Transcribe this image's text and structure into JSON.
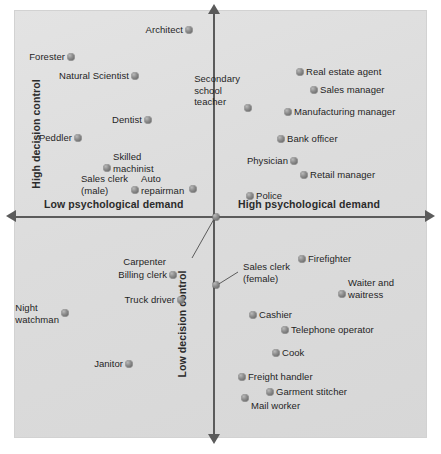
{
  "chart_data": {
    "type": "scatter",
    "title": "",
    "subtitle": "",
    "xlabel": "Psychological demand",
    "ylabel": "Decision control",
    "xlim": [
      0,
      100
    ],
    "ylim": [
      0,
      100
    ],
    "grid": false,
    "legend": null,
    "quadrant_axes": {
      "x_low_label": "Low psychological demand",
      "x_high_label": "High psychological demand",
      "y_high_label": "High decision control",
      "y_low_label": "Low decision control"
    },
    "marker_color": "#7d7d7d",
    "panel_color": "#dedede",
    "axis_color": "#5b5b5b",
    "points": [
      {
        "label": "Architect",
        "x": 42.3,
        "y": 95.3,
        "label_pos": "left",
        "quadrant": "high-control-low-demand"
      },
      {
        "label": "Forester",
        "x": 13.8,
        "y": 89.0,
        "label_pos": "left",
        "quadrant": "high-control-low-demand"
      },
      {
        "label": "Natural Scientist",
        "x": 29.3,
        "y": 84.6,
        "label_pos": "left",
        "quadrant": "high-control-low-demand"
      },
      {
        "label": "Dentist",
        "x": 32.4,
        "y": 74.3,
        "label_pos": "left",
        "quadrant": "high-control-low-demand"
      },
      {
        "label": "Peddler",
        "x": 15.5,
        "y": 70.1,
        "label_pos": "left",
        "quadrant": "high-control-low-demand"
      },
      {
        "label": "Skilled\nmachinist",
        "x": 22.5,
        "y": 63.1,
        "label_pos": "right",
        "quadrant": "high-control-low-demand"
      },
      {
        "label": "Sales clerk\n(male)",
        "x": 29.3,
        "y": 57.9,
        "label_pos": "left",
        "quadrant": "high-control-low-demand"
      },
      {
        "label": "Auto\nrepairman",
        "x": 29.3,
        "y": 57.9,
        "label_pos": "right",
        "quadrant": "high-control-low-demand"
      },
      {
        "label": "",
        "x": 43.3,
        "y": 58.2,
        "label_pos": "none",
        "quadrant": "high-control-low-demand"
      },
      {
        "label": "Real estate agent",
        "x": 69.2,
        "y": 85.5,
        "label_pos": "right",
        "quadrant": "high-control-high-demand"
      },
      {
        "label": "Sales manager",
        "x": 72.6,
        "y": 81.3,
        "label_pos": "right",
        "quadrant": "high-control-high-demand"
      },
      {
        "label": "Secondary\nschool\nteacher",
        "x": 56.6,
        "y": 77.1,
        "label_pos": "above",
        "quadrant": "high-control-high-demand"
      },
      {
        "label": "Manufacturing manager",
        "x": 66.3,
        "y": 76.2,
        "label_pos": "right",
        "quadrant": "high-control-high-demand"
      },
      {
        "label": "Bank officer",
        "x": 64.6,
        "y": 69.9,
        "label_pos": "right",
        "quadrant": "high-control-high-demand"
      },
      {
        "label": "Physician",
        "x": 67.7,
        "y": 64.7,
        "label_pos": "left",
        "quadrant": "high-control-high-demand"
      },
      {
        "label": "Retail manager",
        "x": 70.1,
        "y": 61.4,
        "label_pos": "right",
        "quadrant": "high-control-high-demand"
      },
      {
        "label": "Police",
        "x": 57.1,
        "y": 53.2,
        "label_pos": "right",
        "quadrant": "high-control-high-demand"
      },
      {
        "label": "Carpenter",
        "x": 48.9,
        "y": 50.0,
        "label_pos": "leader-down-left",
        "quadrant": "axis"
      },
      {
        "label": "Billing clerk",
        "x": 38.4,
        "y": 36.2,
        "label_pos": "left",
        "quadrant": "low-control-low-demand"
      },
      {
        "label": "Truck driver",
        "x": 40.4,
        "y": 30.4,
        "label_pos": "left",
        "quadrant": "low-control-low-demand"
      },
      {
        "label": "Night\nwatchman",
        "x": 12.4,
        "y": 27.3,
        "label_pos": "left",
        "quadrant": "low-control-low-demand"
      },
      {
        "label": "Janitor",
        "x": 27.9,
        "y": 15.4,
        "label_pos": "left",
        "quadrant": "low-control-low-demand"
      },
      {
        "label": "",
        "x": 48.7,
        "y": 33.9,
        "label_pos": "none",
        "quadrant": "axis"
      },
      {
        "label": "Sales clerk\n(female)",
        "x": 48.7,
        "y": 33.9,
        "label_pos": "leader-right",
        "quadrant": "low-control-high-demand"
      },
      {
        "label": "Firefighter",
        "x": 69.7,
        "y": 40.0,
        "label_pos": "right",
        "quadrant": "low-control-high-demand"
      },
      {
        "label": "Waiter and\nwaitress",
        "x": 79.4,
        "y": 31.8,
        "label_pos": "right",
        "quadrant": "low-control-high-demand"
      },
      {
        "label": "Cashier",
        "x": 57.9,
        "y": 26.9,
        "label_pos": "right",
        "quadrant": "low-control-high-demand"
      },
      {
        "label": "Telephone operator",
        "x": 65.6,
        "y": 23.4,
        "label_pos": "right",
        "quadrant": "low-control-high-demand"
      },
      {
        "label": "Cook",
        "x": 63.4,
        "y": 18.0,
        "label_pos": "right",
        "quadrant": "low-control-high-demand"
      },
      {
        "label": "Freight handler",
        "x": 55.2,
        "y": 12.4,
        "label_pos": "right",
        "quadrant": "low-control-high-demand"
      },
      {
        "label": "Garment stitcher",
        "x": 62.0,
        "y": 8.9,
        "label_pos": "right",
        "quadrant": "low-control-high-demand"
      },
      {
        "label": "Mail worker",
        "x": 56.0,
        "y": 7.5,
        "label_pos": "right-below",
        "quadrant": "low-control-high-demand"
      }
    ]
  },
  "axes": {
    "x_low": "Low psychological demand",
    "x_high": "High psychological demand",
    "y_high": "High decision control",
    "y_low": "Low decision control"
  },
  "points": [
    {
      "name": "architect",
      "text": "Architect",
      "dx": 189,
      "dy": 30,
      "lx": 183,
      "ly": 30,
      "anchor": "left"
    },
    {
      "name": "forester",
      "text": "Forester",
      "dx": 71,
      "dy": 57,
      "lx": 65,
      "ly": 57,
      "anchor": "left"
    },
    {
      "name": "natural-scientist",
      "text": "Natural Scientist",
      "dx": 135,
      "dy": 76,
      "lx": 129,
      "ly": 76,
      "anchor": "left"
    },
    {
      "name": "dentist",
      "text": "Dentist",
      "dx": 148,
      "dy": 120,
      "lx": 142,
      "ly": 120,
      "anchor": "left"
    },
    {
      "name": "peddler",
      "text": "Peddler",
      "dx": 78,
      "dy": 138,
      "lx": 72,
      "ly": 138,
      "anchor": "left"
    },
    {
      "name": "skilled-machinist",
      "text": "Skilled\nmachinist",
      "dx": 107,
      "dy": 168,
      "lx": 113,
      "ly": 162,
      "anchor": "right"
    },
    {
      "name": "sales-clerk-male",
      "text": "Sales clerk\n(male)",
      "dx": 0,
      "dy": 0,
      "lx": 128,
      "ly": 184,
      "anchor": "left-block"
    },
    {
      "name": "auto-repairman",
      "text": "Auto\nrepairman",
      "dx": 135,
      "dy": 190,
      "lx": 141,
      "ly": 184,
      "anchor": "right"
    },
    {
      "name": "unlabeled-ul",
      "text": "",
      "dx": 193,
      "dy": 189,
      "lx": 0,
      "ly": 0,
      "anchor": "none"
    },
    {
      "name": "real-estate-agent",
      "text": "Real estate agent",
      "dx": 300,
      "dy": 72,
      "lx": 306,
      "ly": 72,
      "anchor": "right"
    },
    {
      "name": "sales-manager",
      "text": "Sales manager",
      "dx": 314,
      "dy": 90,
      "lx": 320,
      "ly": 90,
      "anchor": "right"
    },
    {
      "name": "secondary-school-teacher",
      "text": "Secondary\nschool\nteacher",
      "dx": 248,
      "dy": 108,
      "lx": 240,
      "ly": 73,
      "anchor": "block-above"
    },
    {
      "name": "manufacturing-manager",
      "text": "Manufacturing manager",
      "dx": 288,
      "dy": 112,
      "lx": 294,
      "ly": 112,
      "anchor": "right"
    },
    {
      "name": "bank-officer",
      "text": "Bank officer",
      "dx": 281,
      "dy": 139,
      "lx": 287,
      "ly": 139,
      "anchor": "right"
    },
    {
      "name": "physician",
      "text": "Physician",
      "dx": 294,
      "dy": 161,
      "lx": 288,
      "ly": 161,
      "anchor": "left"
    },
    {
      "name": "retail-manager",
      "text": "Retail manager",
      "dx": 304,
      "dy": 175,
      "lx": 310,
      "ly": 175,
      "anchor": "right"
    },
    {
      "name": "police",
      "text": "Police",
      "dx": 250,
      "dy": 196,
      "lx": 256,
      "ly": 196,
      "anchor": "right"
    },
    {
      "name": "carpenter",
      "text": "Carpenter",
      "dx": 216,
      "dy": 217,
      "lx": 166,
      "ly": 262,
      "anchor": "leader-label"
    },
    {
      "name": "billing-clerk",
      "text": "Billing clerk",
      "dx": 173,
      "dy": 275,
      "lx": 167,
      "ly": 275,
      "anchor": "left"
    },
    {
      "name": "truck-driver",
      "text": "Truck driver",
      "dx": 181,
      "dy": 300,
      "lx": 175,
      "ly": 300,
      "anchor": "left"
    },
    {
      "name": "night-watchman",
      "text": "Night\nwatchman",
      "dx": 65,
      "dy": 313,
      "lx": 59,
      "ly": 313,
      "anchor": "left-block"
    },
    {
      "name": "janitor",
      "text": "Janitor",
      "dx": 129,
      "dy": 364,
      "lx": 123,
      "ly": 364,
      "anchor": "left"
    },
    {
      "name": "sales-clerk-female-dot",
      "text": "",
      "dx": 216,
      "dy": 285,
      "lx": 0,
      "ly": 0,
      "anchor": "none"
    },
    {
      "name": "sales-clerk-female",
      "text": "Sales clerk\n(female)",
      "dx": 0,
      "dy": 0,
      "lx": 243,
      "ly": 272,
      "anchor": "leader-label-right"
    },
    {
      "name": "firefighter",
      "text": "Firefighter",
      "dx": 302,
      "dy": 259,
      "lx": 308,
      "ly": 259,
      "anchor": "right"
    },
    {
      "name": "waiter-and-waitress",
      "text": "Waiter and\nwaitress",
      "dx": 342,
      "dy": 294,
      "lx": 348,
      "ly": 288,
      "anchor": "right"
    },
    {
      "name": "cashier",
      "text": "Cashier",
      "dx": 253,
      "dy": 315,
      "lx": 259,
      "ly": 315,
      "anchor": "right"
    },
    {
      "name": "telephone-operator",
      "text": "Telephone operator",
      "dx": 285,
      "dy": 330,
      "lx": 291,
      "ly": 330,
      "anchor": "right"
    },
    {
      "name": "cook",
      "text": "Cook",
      "dx": 276,
      "dy": 353,
      "lx": 282,
      "ly": 353,
      "anchor": "right"
    },
    {
      "name": "freight-handler",
      "text": "Freight handler",
      "dx": 242,
      "dy": 377,
      "lx": 248,
      "ly": 377,
      "anchor": "right"
    },
    {
      "name": "garment-stitcher",
      "text": "Garment stitcher",
      "dx": 270,
      "dy": 392,
      "lx": 276,
      "ly": 392,
      "anchor": "right"
    },
    {
      "name": "mail-worker",
      "text": "Mail worker",
      "dx": 245,
      "dy": 398,
      "lx": 251,
      "ly": 406,
      "anchor": "right"
    }
  ]
}
